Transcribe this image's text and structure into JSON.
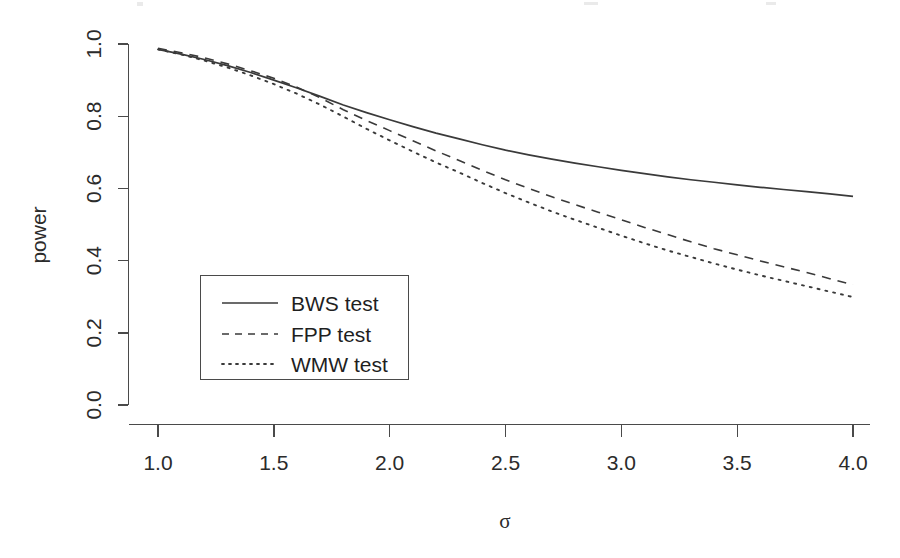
{
  "chart_data": {
    "type": "line",
    "title": "",
    "xlabel": "σ",
    "ylabel": "power",
    "xlim": [
      0.9,
      4.12
    ],
    "ylim": [
      -0.03,
      1.03
    ],
    "grid": false,
    "legend_position": "center-left",
    "xticks": [
      "1.0",
      "1.5",
      "2.0",
      "2.5",
      "3.0",
      "3.5",
      "4.0"
    ],
    "xtick_values": [
      1.0,
      1.5,
      2.0,
      2.5,
      3.0,
      3.5,
      4.0
    ],
    "yticks": [
      "0.0",
      "0.2",
      "0.4",
      "0.6",
      "0.8",
      "1.0"
    ],
    "ytick_values": [
      0.0,
      0.2,
      0.4,
      0.6,
      0.8,
      1.0
    ],
    "x": [
      1.0,
      1.1,
      1.2,
      1.3,
      1.4,
      1.5,
      1.6,
      1.7,
      1.8,
      1.9,
      2.0,
      2.1,
      2.2,
      2.3,
      2.4,
      2.5,
      2.6,
      2.7,
      2.8,
      2.9,
      3.0,
      3.1,
      3.2,
      3.3,
      3.4,
      3.5,
      3.6,
      3.7,
      3.8,
      3.9,
      4.0
    ],
    "series": [
      {
        "name": "BWS test",
        "style": "solid",
        "color": "#3a3a3a",
        "values": [
          0.985,
          0.972,
          0.957,
          0.94,
          0.921,
          0.9,
          0.878,
          0.855,
          0.831,
          0.81,
          0.79,
          0.771,
          0.753,
          0.737,
          0.721,
          0.706,
          0.693,
          0.681,
          0.67,
          0.66,
          0.65,
          0.641,
          0.632,
          0.624,
          0.617,
          0.61,
          0.603,
          0.597,
          0.591,
          0.585,
          0.578
        ]
      },
      {
        "name": "FPP test",
        "style": "dashed",
        "color": "#3a3a3a",
        "values": [
          0.988,
          0.976,
          0.962,
          0.945,
          0.926,
          0.905,
          0.88,
          0.851,
          0.818,
          0.788,
          0.76,
          0.732,
          0.704,
          0.677,
          0.65,
          0.624,
          0.6,
          0.577,
          0.555,
          0.534,
          0.513,
          0.492,
          0.472,
          0.452,
          0.433,
          0.416,
          0.399,
          0.383,
          0.367,
          0.35,
          0.333
        ]
      },
      {
        "name": "WMW test",
        "style": "dotted",
        "color": "#3a3a3a",
        "values": [
          0.985,
          0.971,
          0.954,
          0.935,
          0.913,
          0.889,
          0.862,
          0.832,
          0.799,
          0.765,
          0.733,
          0.702,
          0.672,
          0.644,
          0.615,
          0.587,
          0.561,
          0.536,
          0.513,
          0.491,
          0.469,
          0.448,
          0.428,
          0.41,
          0.392,
          0.375,
          0.359,
          0.344,
          0.329,
          0.314,
          0.299
        ]
      }
    ]
  },
  "legend": {
    "entries": [
      {
        "label": "BWS test",
        "style": "solid"
      },
      {
        "label": "FPP test",
        "style": "dashed"
      },
      {
        "label": "WMW test",
        "style": "dotted"
      }
    ]
  },
  "axes": {
    "y_title": "power",
    "x_title": "σ"
  }
}
